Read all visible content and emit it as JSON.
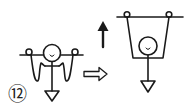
{
  "diagram": {
    "step_label": "⑫",
    "colors": {
      "stroke": "#1a1a1a",
      "background": "#ffffff"
    },
    "figures": [
      {
        "name": "before",
        "description": "Figure with head circle on horizontal bar, two end rings, loops hanging down, stem with downward triangle"
      },
      {
        "name": "after",
        "description": "Figure lowered into a trapezoid sling hanging from the bar rings, stem with downward triangle"
      }
    ],
    "arrows": [
      {
        "name": "transition-arrow",
        "style": "hollow",
        "direction": "right"
      },
      {
        "name": "lift-arrow",
        "style": "solid",
        "direction": "up"
      }
    ],
    "head_mark": "u"
  }
}
